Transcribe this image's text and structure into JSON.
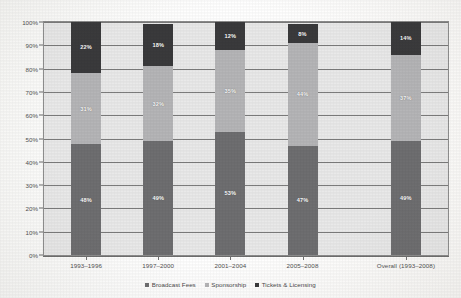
{
  "chart_data": {
    "type": "bar",
    "subtype": "stacked-100-percent",
    "title": "",
    "xlabel": "",
    "ylabel": "",
    "ylim": [
      0,
      100
    ],
    "y_unit": "%",
    "grid": true,
    "legend_position": "bottom",
    "categories": [
      "1993–1996",
      "1997–2000",
      "2001–2004",
      "2005–2008",
      "Overall (1993–2008)"
    ],
    "yticks": [
      "0%",
      "10%",
      "20%",
      "30%",
      "40%",
      "50%",
      "60%",
      "70%",
      "80%",
      "90%",
      "100%"
    ],
    "ytick_values": [
      0,
      10,
      20,
      30,
      40,
      50,
      60,
      70,
      80,
      90,
      100
    ],
    "series": [
      {
        "name": "Broadcast Fees",
        "color": "#6e6e70",
        "values": [
          48,
          49,
          53,
          47,
          49
        ],
        "labels": [
          "48%",
          "49%",
          "53%",
          "47%",
          "49%"
        ]
      },
      {
        "name": "Sponsorship",
        "color": "#b5b5b7",
        "values": [
          31,
          32,
          35,
          44,
          37
        ],
        "labels": [
          "31%",
          "32%",
          "35%",
          "44%",
          "37%"
        ]
      },
      {
        "name": "Tickets & Licensing",
        "color": "#3a3a3c",
        "values": [
          22,
          18,
          12,
          8,
          14
        ],
        "labels": [
          "22%",
          "18%",
          "12%",
          "8%",
          "14%"
        ]
      }
    ]
  },
  "legend": {
    "items": [
      {
        "label": "Broadcast Fees",
        "color": "#6e6e70"
      },
      {
        "label": "Sponsorship",
        "color": "#b5b5b7"
      },
      {
        "label": "Tickets & Licensing",
        "color": "#3a3a3c"
      }
    ]
  },
  "colors": {
    "plot_background": "#e9e9e9",
    "gridline": "#7c7c7c",
    "axis": "#6f6f6f",
    "text": "#4f4f4f",
    "label_text": "#ffffff"
  }
}
